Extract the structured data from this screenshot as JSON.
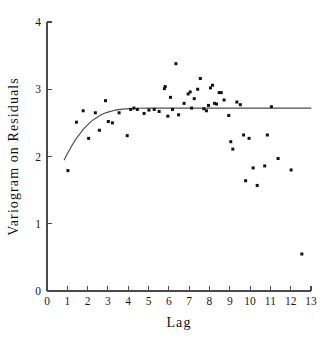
{
  "chart_data": {
    "type": "scatter",
    "title": "",
    "xlabel": "Lag",
    "ylabel": "Variogram on Residuals",
    "xlim": [
      0,
      13
    ],
    "ylim": [
      0,
      4
    ],
    "xticks": [
      0,
      1,
      2,
      3,
      4,
      5,
      6,
      7,
      8,
      9,
      10,
      11,
      12,
      13
    ],
    "xtick_labels": [
      "0",
      "1",
      "2",
      "3",
      "4",
      "5",
      "6",
      "7",
      "8",
      "9",
      "10",
      "11",
      "12",
      "13"
    ],
    "yticks": [
      0,
      1,
      2,
      3,
      4
    ],
    "ytick_labels": [
      "0",
      "1",
      "2",
      "3",
      "4"
    ],
    "grid": false,
    "legend": "none",
    "point_color": "#111111",
    "curve_color": "#4d4d4d",
    "axis_color": "#4a4a4a",
    "series": [
      {
        "name": "Variogram on Residuals",
        "marker": "square-dot",
        "x": [
          1.03,
          1.45,
          1.78,
          2.05,
          2.38,
          2.58,
          2.88,
          3.02,
          3.22,
          3.55,
          3.95,
          4.12,
          4.28,
          4.45,
          4.78,
          5.02,
          5.28,
          5.52,
          5.78,
          5.82,
          5.95,
          6.08,
          6.18,
          6.35,
          6.48,
          6.75,
          6.95,
          7.05,
          7.12,
          7.25,
          7.42,
          7.55,
          7.72,
          7.85,
          7.95,
          8.05,
          8.15,
          8.25,
          8.35,
          8.48,
          8.58,
          8.72,
          8.95,
          9.05,
          9.15,
          9.35,
          9.52,
          9.68,
          9.78,
          9.95,
          10.15,
          10.35,
          10.72,
          10.85,
          11.05,
          11.38,
          12.02,
          12.55
        ],
        "y": [
          1.79,
          2.51,
          2.68,
          2.27,
          2.65,
          2.39,
          2.83,
          2.52,
          2.5,
          2.65,
          2.31,
          2.7,
          2.72,
          2.7,
          2.64,
          2.69,
          2.7,
          2.67,
          3.01,
          3.04,
          2.6,
          2.88,
          2.7,
          3.38,
          2.62,
          2.79,
          2.93,
          2.96,
          2.72,
          2.86,
          3.0,
          3.16,
          2.71,
          2.68,
          2.76,
          3.02,
          3.06,
          2.79,
          2.78,
          2.95,
          2.95,
          2.84,
          2.61,
          2.22,
          2.11,
          2.81,
          2.77,
          2.32,
          1.64,
          2.27,
          1.83,
          1.57,
          1.86,
          2.32,
          2.74,
          1.97,
          1.8,
          0.55
        ]
      }
    ],
    "fitted_curve": {
      "name": "exponential variogram model",
      "style": "solid",
      "nugget_start": 1.95,
      "sill": 2.72,
      "x_start": 0.85,
      "x_end": 13.0,
      "x": [
        0.85,
        1.0,
        1.2,
        1.4,
        1.6,
        1.8,
        2.0,
        2.2,
        2.4,
        2.6,
        2.8,
        3.0,
        3.3,
        3.6,
        3.9,
        4.2,
        4.5,
        5.0,
        5.5,
        6.0,
        7.0,
        8.0,
        9.0,
        10.0,
        11.0,
        12.0,
        13.0
      ],
      "y": [
        1.95,
        2.04,
        2.15,
        2.25,
        2.33,
        2.41,
        2.47,
        2.53,
        2.57,
        2.61,
        2.64,
        2.66,
        2.685,
        2.7,
        2.708,
        2.714,
        2.717,
        2.72,
        2.72,
        2.72,
        2.72,
        2.72,
        2.72,
        2.72,
        2.72,
        2.72,
        2.72
      ]
    }
  }
}
